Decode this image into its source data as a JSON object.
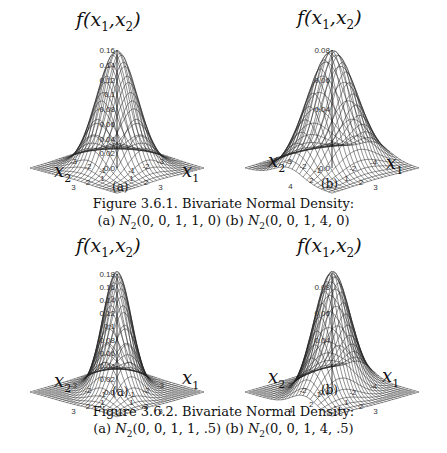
{
  "figures": [
    {
      "caption_title": "Figure 3.6.1. Bivariate Normal Density:",
      "caption_a_prefix": "(a) ",
      "caption_a_params": "(0, 0, 1, 1, 0)",
      "caption_b_prefix": " (b) ",
      "caption_b_params": "(0, 0, 1, 4, 0)",
      "dist_symbol": "N",
      "dist_sub": "2"
    },
    {
      "caption_title": "Figure 3.6.2. Bivariate Normal Density:",
      "caption_a_prefix": "(a) ",
      "caption_a_params": "(0, 0, 1, 1, .5)",
      "caption_b_prefix": " (b) ",
      "caption_b_params": "(0, 0, 1, 4, .5)",
      "dist_symbol": "N",
      "dist_sub": "2"
    }
  ],
  "labels": {
    "f": "f",
    "open": "(",
    "x": "x",
    "sub1": "1",
    "comma": ",",
    "sub2": "2",
    "close": ")"
  },
  "chart_data": [
    {
      "type": "surface",
      "panel": "(a)",
      "figure": "3.6.1",
      "title": "f(x1,x2)",
      "distribution": "N2(0,0,1,1,0)",
      "params": {
        "mu1": 0,
        "mu2": 0,
        "var1": 1,
        "var2": 1,
        "rho": 0
      },
      "xlabel": "x1",
      "ylabel": "x2",
      "x_ticks": [
        "-3",
        "-2",
        "-1",
        "0",
        "1",
        "2",
        "3"
      ],
      "y_ticks": [
        "-3",
        "-2",
        "-1",
        "0",
        "1",
        "2",
        "3"
      ],
      "z_ticks": [
        "0.0",
        "0.02",
        "0.04",
        "0.06",
        "0.08",
        "0.1",
        "0.12",
        "0.14",
        "0.16"
      ],
      "zlim": [
        0,
        0.16
      ],
      "peak": 0.159,
      "range": 3
    },
    {
      "type": "surface",
      "panel": "(b)",
      "figure": "3.6.1",
      "title": "f(x1,x2)",
      "distribution": "N2(0,0,1,4,0)",
      "params": {
        "mu1": 0,
        "mu2": 0,
        "var1": 1,
        "var2": 4,
        "rho": 0
      },
      "xlabel": "x1",
      "ylabel": "x2",
      "x_ticks": [
        "-3",
        "-2",
        "-1",
        "0",
        "1",
        "2",
        "3"
      ],
      "y_ticks": [
        "-4",
        "-2",
        "0",
        "2",
        "4"
      ],
      "z_ticks": [
        "0.0",
        "0.04",
        "0.06",
        "0.08"
      ],
      "zlim": [
        0,
        0.08
      ],
      "peak": 0.0796,
      "range": 3
    },
    {
      "type": "surface",
      "panel": "(a)",
      "figure": "3.6.2",
      "title": "f(x1,x2)",
      "distribution": "N2(0,0,1,1,.5)",
      "params": {
        "mu1": 0,
        "mu2": 0,
        "var1": 1,
        "var2": 1,
        "rho": 0.5
      },
      "xlabel": "x1",
      "ylabel": "x2",
      "x_ticks": [
        "-3",
        "-2",
        "-1",
        "0",
        "1",
        "2",
        "3"
      ],
      "y_ticks": [
        "-3",
        "-2",
        "-1",
        "0",
        "1",
        "2",
        "3"
      ],
      "z_ticks": [
        "0.0",
        "0.02",
        "0.04",
        "0.06",
        "0.08",
        "0.1",
        "0.12",
        "0.14",
        "0.16",
        "0.18"
      ],
      "zlim": [
        0,
        0.18
      ],
      "peak": 0.1838,
      "range": 3
    },
    {
      "type": "surface",
      "panel": "(b)",
      "figure": "3.6.2",
      "title": "f(x1,x2)",
      "distribution": "N2(0,0,1,4,.5)",
      "params": {
        "mu1": 0,
        "mu2": 0,
        "var1": 1,
        "var2": 4,
        "rho": 0.5
      },
      "xlabel": "x1",
      "ylabel": "x2",
      "x_ticks": [
        "-3",
        "-2",
        "-1",
        "0",
        "1",
        "2",
        "3"
      ],
      "y_ticks": [
        "-4",
        "-2",
        "0",
        "2",
        "4"
      ],
      "z_ticks": [
        "0.0",
        "0.04",
        "0.06",
        "0.08"
      ],
      "zlim": [
        0,
        0.09
      ],
      "peak": 0.0919,
      "range": 3
    }
  ]
}
